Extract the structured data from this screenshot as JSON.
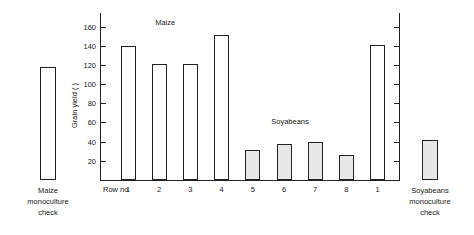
{
  "chart_data": {
    "type": "bar",
    "title": "",
    "xlabel": "Row no",
    "ylabel": "Grain yield (  )",
    "ylim": [
      0,
      170
    ],
    "yticks": [
      20,
      40,
      60,
      80,
      100,
      120,
      140,
      160
    ],
    "ytick_labels": [
      "20",
      "40",
      "60",
      "80",
      "100",
      "120",
      "140",
      "160"
    ],
    "grid": false,
    "legend": "none",
    "series_labels": [
      {
        "text": "Maize",
        "x_category": "2",
        "value_y": 165
      },
      {
        "text": "Soyabeans",
        "x_category": "6",
        "value_y": 62
      }
    ],
    "categories": [
      "1",
      "2",
      "3",
      "4",
      "5",
      "6",
      "7",
      "8",
      "1"
    ],
    "values": [
      140,
      121,
      121,
      151,
      31,
      38,
      40,
      26,
      141
    ],
    "crop_of_bar": [
      "Maize",
      "Maize",
      "Maize",
      "Maize",
      "Soyabeans",
      "Soyabeans",
      "Soyabeans",
      "Soyabeans",
      "Maize"
    ],
    "bar_styles": [
      "open",
      "open",
      "open",
      "open",
      "shaded",
      "shaded",
      "shaded",
      "shaded",
      "open"
    ],
    "side_bars": [
      {
        "position": "left",
        "value": 118,
        "style": "open",
        "caption": "Maize monoculture check",
        "caption_lines": [
          "Maize",
          "monoculture",
          "check"
        ]
      },
      {
        "position": "right",
        "value": 42,
        "style": "shaded",
        "caption": "Soyabeans monoculture check",
        "caption_lines": [
          "Soyabeans",
          "monoculture",
          "check"
        ]
      }
    ],
    "right_axis": {
      "visible": true,
      "labels": []
    }
  },
  "axis": {
    "row_no_label": "Row no",
    "y_axis_label": "Grain yield (  )"
  },
  "plot_labels": {
    "maize": "Maize",
    "soyabeans": "Soyabeans"
  },
  "left_check": {
    "line1": "Maize",
    "line2": "monoculture",
    "line3": "check"
  },
  "right_check": {
    "line1": "Soyabeans",
    "line2": "monoculture",
    "line3": "check"
  },
  "colors": {
    "ink": "#222222",
    "open_bar_fill": "#ffffff",
    "shaded_bar_fill": "#e8e8e8",
    "background": "#ffffff"
  }
}
